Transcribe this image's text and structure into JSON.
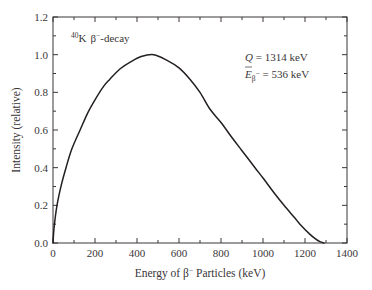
{
  "chart_data": {
    "type": "line",
    "title": "",
    "xlabel": "Energy of β⁻ Particles (keV)",
    "xlabel_parts": {
      "pre": "Energy of β",
      "sup": "−",
      "post": " Particles (keV)"
    },
    "ylabel": "Intensity (relative)",
    "xlim": [
      0,
      1400
    ],
    "ylim": [
      0,
      1.2
    ],
    "xticks": [
      0,
      200,
      400,
      600,
      800,
      1000,
      1200,
      1400
    ],
    "xtick_labels": [
      "0",
      "200",
      "400",
      "600",
      "800",
      "1000",
      "1200",
      "1400"
    ],
    "xminor_step": 100,
    "yticks": [
      0.0,
      0.2,
      0.4,
      0.6,
      0.8,
      1.0,
      1.2
    ],
    "ytick_labels": [
      "0.0",
      "0.2",
      "0.4",
      "0.6",
      "0.8",
      "1.0",
      "1.2"
    ],
    "yminor_step": 0.1,
    "grid": false,
    "legend": null,
    "series": [
      {
        "name": "40K β− spectrum",
        "color": "#231f20",
        "x": [
          0,
          5,
          19,
          40,
          62,
          90,
          129,
          165,
          200,
          240,
          271,
          320,
          367,
          420,
          480,
          543,
          600,
          652,
          700,
          748,
          800,
          852,
          900,
          962,
          1000,
          1057,
          1100,
          1150,
          1176,
          1220,
          1250,
          1271,
          1290
        ],
        "y": [
          0.0,
          0.08,
          0.2,
          0.31,
          0.4,
          0.5,
          0.6,
          0.69,
          0.76,
          0.83,
          0.87,
          0.925,
          0.96,
          0.99,
          1.0,
          0.97,
          0.93,
          0.87,
          0.8,
          0.71,
          0.64,
          0.56,
          0.49,
          0.4,
          0.345,
          0.26,
          0.2,
          0.135,
          0.1,
          0.05,
          0.022,
          0.007,
          0.0
        ]
      }
    ],
    "annotations": {
      "isotope": {
        "mass_number": "40",
        "element": "K",
        "decay": "β",
        "decay_sup": "−",
        "suffix": "-decay"
      },
      "q_value": {
        "symbol": "Q",
        "text": " = 1314 keV",
        "value_keV": 1314
      },
      "mean_energy": {
        "symbol": "E",
        "sub": "β",
        "sub_sup": "−",
        "text": " = 536 keV",
        "value_keV": 536
      }
    }
  }
}
